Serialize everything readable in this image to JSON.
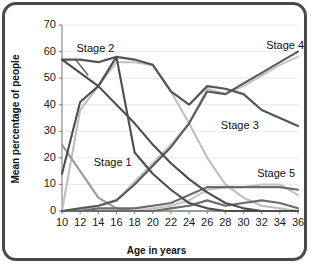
{
  "chart_data": {
    "type": "line",
    "title": "",
    "xlabel": "Age in years",
    "ylabel": "Mean percentage of people",
    "xlim": [
      10,
      36
    ],
    "ylim": [
      0,
      70
    ],
    "yticks": [
      0,
      10,
      20,
      30,
      40,
      50,
      60,
      70
    ],
    "xticks": [
      10,
      12,
      14,
      16,
      18,
      20,
      22,
      24,
      26,
      28,
      30,
      32,
      34,
      36
    ],
    "grid": true,
    "grid_axis": "y",
    "legend_position": "inline-annotations",
    "x": [
      10,
      12,
      14,
      16,
      18,
      20,
      22,
      24,
      26,
      28,
      30,
      32,
      34,
      36
    ],
    "series": [
      {
        "name": "Stage 1",
        "color": "#9a9a9a",
        "label_text": "Stage 1",
        "values": [
          25,
          15,
          5,
          1,
          0,
          0,
          0,
          0,
          0,
          0,
          0,
          0,
          0,
          0
        ]
      },
      {
        "name": "Stage 2",
        "color": "#4d4d4d",
        "label_text": "Stage 2",
        "values": [
          14,
          41,
          47,
          58,
          22,
          14,
          8,
          3,
          1,
          0,
          0,
          0,
          0,
          0
        ]
      },
      {
        "name": "Stage 2b",
        "color": "#bfbfbf",
        "label_text": "",
        "values": [
          0,
          38,
          47,
          56,
          56,
          55,
          45,
          33,
          20,
          10,
          5,
          2,
          1,
          0
        ]
      },
      {
        "name": "Stage 3",
        "color": "#555555",
        "label_text": "Stage 3",
        "values": [
          0,
          0,
          0,
          1,
          2,
          6,
          18,
          33,
          47,
          46,
          44,
          40,
          36,
          32
        ],
        "values_alt": [
          57,
          57,
          56,
          58,
          57,
          55,
          45,
          40,
          47,
          46,
          44,
          38,
          35,
          32
        ]
      },
      {
        "name": "Stage 4",
        "color": "#595959",
        "label_text": "Stage 4",
        "values": [
          0,
          1,
          2,
          4,
          10,
          17,
          24,
          33,
          45,
          44,
          48,
          52,
          56,
          60
        ]
      },
      {
        "name": "Stage 4b",
        "color": "#c4c4c4",
        "label_text": "",
        "values": [
          0,
          1,
          2,
          4,
          11,
          18,
          25,
          33,
          46,
          44,
          47,
          51,
          55,
          58
        ]
      },
      {
        "name": "Stage 5",
        "color": "#6b6b6b",
        "label_text": "Stage 5",
        "values": [
          0,
          0,
          1,
          1,
          1,
          2,
          3,
          6,
          9,
          9,
          9,
          9,
          9,
          8
        ]
      },
      {
        "name": "Stage 5b",
        "color": "#c4c4c4",
        "label_text": "",
        "values": [
          0,
          0,
          0,
          0,
          0,
          1,
          2,
          4,
          8,
          9,
          9,
          10,
          10,
          6
        ]
      },
      {
        "name": "Stage 5c",
        "color": "#6b6b6b",
        "label_text": "",
        "values": [
          0,
          0,
          0,
          0,
          0,
          0,
          1,
          2,
          4,
          2,
          3,
          4,
          3,
          1
        ]
      }
    ],
    "stage2_descending": {
      "name": "Stage 2 descending branch",
      "color": "#4d4d4d",
      "values": [
        57,
        52,
        47,
        40,
        33,
        25,
        18,
        12,
        7,
        3,
        1,
        0,
        0,
        0
      ]
    },
    "annotations": [
      {
        "text": "Stage 1",
        "x": 13.5,
        "y": 18,
        "series": "Stage 1"
      },
      {
        "text": "Stage 2",
        "x": 11.6,
        "y": 61,
        "series": "Stage 2"
      },
      {
        "text": "Stage 3",
        "x": 27.5,
        "y": 32,
        "series": "Stage 3"
      },
      {
        "text": "Stage 4",
        "x": 32.5,
        "y": 62,
        "series": "Stage 4"
      },
      {
        "text": "Stage 5",
        "x": 31.5,
        "y": 14,
        "series": "Stage 5"
      }
    ]
  },
  "style": {
    "frame_color": "#4a4a4a",
    "grid_color": "#e8e8e8",
    "axis_color": "#8a8a8a",
    "text_color": "#111111"
  }
}
